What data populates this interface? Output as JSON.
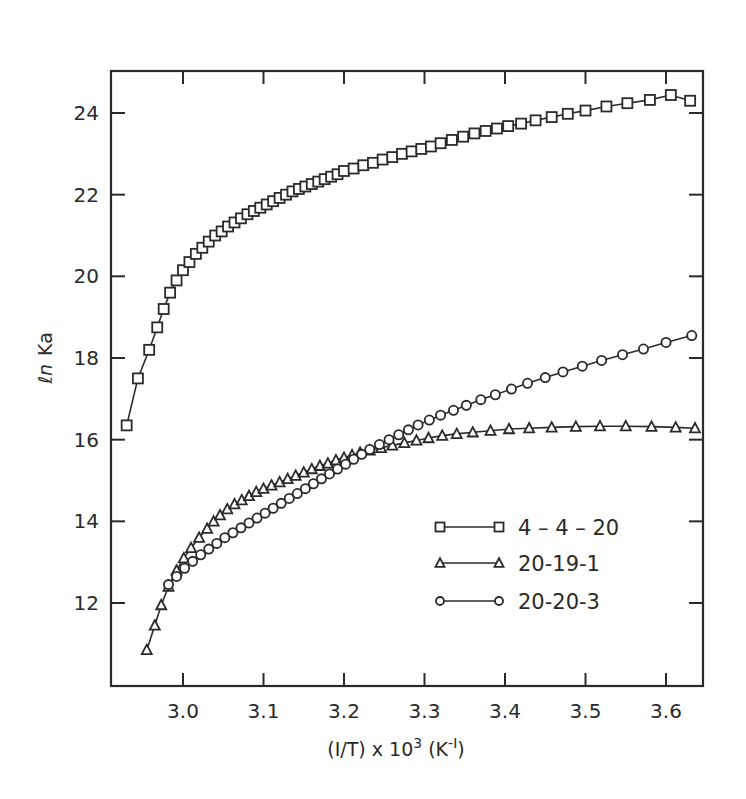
{
  "chart_data": {
    "type": "line",
    "title": "",
    "xlabel": "(I/T) x 10^3 (K^-1)",
    "xlabel_parts": {
      "prefix": "(I/T)  x  10",
      "sup": "3",
      "mid": " (K",
      "sup2": "-I",
      "suffix": ")"
    },
    "ylabel": "ln Ka",
    "ylabel_parts": {
      "ln": "ℓn",
      "k": "Ka"
    },
    "xlim": [
      2.91,
      3.645
    ],
    "ylim": [
      10.35,
      25.35
    ],
    "xticks": [
      3.0,
      3.1,
      3.2,
      3.3,
      3.4,
      3.5,
      3.6
    ],
    "xtick_labels": [
      "3.0",
      "3.1",
      "3.2",
      "3.3",
      "3.4",
      "3.5",
      "3.6"
    ],
    "yticks": [
      12,
      14,
      16,
      18,
      20,
      22,
      24
    ],
    "ytick_labels": [
      "12",
      "14",
      "16",
      "18",
      "20",
      "22",
      "24"
    ],
    "grid": false,
    "legend_position": "lower right",
    "series": [
      {
        "name": "4-4-20",
        "label": "4 – 4 – 20",
        "marker": "square",
        "x": [
          2.93,
          2.944,
          2.958,
          2.968,
          2.976,
          2.984,
          2.992,
          3.0,
          3.008,
          3.016,
          3.024,
          3.032,
          3.04,
          3.048,
          3.056,
          3.064,
          3.072,
          3.08,
          3.088,
          3.096,
          3.104,
          3.112,
          3.12,
          3.128,
          3.136,
          3.144,
          3.152,
          3.16,
          3.168,
          3.176,
          3.184,
          3.192,
          3.2,
          3.212,
          3.224,
          3.236,
          3.248,
          3.26,
          3.272,
          3.284,
          3.296,
          3.308,
          3.32,
          3.334,
          3.348,
          3.362,
          3.376,
          3.39,
          3.404,
          3.42,
          3.438,
          3.458,
          3.478,
          3.5,
          3.526,
          3.552,
          3.58,
          3.606,
          3.63
        ],
        "y": [
          16.35,
          17.5,
          18.2,
          18.75,
          19.2,
          19.6,
          19.9,
          20.15,
          20.35,
          20.55,
          20.7,
          20.85,
          21.0,
          21.1,
          21.22,
          21.32,
          21.42,
          21.52,
          21.6,
          21.68,
          21.76,
          21.84,
          21.92,
          22.0,
          22.08,
          22.14,
          22.2,
          22.26,
          22.32,
          22.38,
          22.44,
          22.5,
          22.58,
          22.64,
          22.72,
          22.78,
          22.86,
          22.92,
          23.0,
          23.06,
          23.12,
          23.18,
          23.26,
          23.34,
          23.42,
          23.5,
          23.56,
          23.62,
          23.68,
          23.74,
          23.82,
          23.9,
          23.98,
          24.06,
          24.16,
          24.24,
          24.32,
          24.44,
          24.3
        ]
      },
      {
        "name": "20-19-1",
        "label": "20-19-1",
        "marker": "triangle",
        "x": [
          2.955,
          2.965,
          2.973,
          2.982,
          2.992,
          3.001,
          3.01,
          3.02,
          3.03,
          3.038,
          3.046,
          3.055,
          3.064,
          3.073,
          3.082,
          3.091,
          3.1,
          3.11,
          3.12,
          3.13,
          3.14,
          3.15,
          3.16,
          3.17,
          3.18,
          3.19,
          3.2,
          3.21,
          3.22,
          3.232,
          3.246,
          3.26,
          3.275,
          3.29,
          3.305,
          3.322,
          3.34,
          3.36,
          3.382,
          3.405,
          3.43,
          3.458,
          3.488,
          3.518,
          3.55,
          3.582,
          3.612,
          3.636
        ],
        "y": [
          10.85,
          11.45,
          11.95,
          12.4,
          12.8,
          13.1,
          13.35,
          13.6,
          13.82,
          14.0,
          14.15,
          14.3,
          14.42,
          14.52,
          14.62,
          14.72,
          14.8,
          14.88,
          14.96,
          15.04,
          15.12,
          15.2,
          15.28,
          15.36,
          15.42,
          15.5,
          15.56,
          15.62,
          15.68,
          15.74,
          15.8,
          15.86,
          15.92,
          15.98,
          16.04,
          16.1,
          16.14,
          16.18,
          16.22,
          16.26,
          16.28,
          16.3,
          16.32,
          16.33,
          16.33,
          16.32,
          16.3,
          16.28
        ]
      },
      {
        "name": "20-20-3",
        "label": "20-20-3",
        "marker": "circle",
        "x": [
          2.982,
          2.992,
          3.002,
          3.012,
          3.022,
          3.032,
          3.042,
          3.052,
          3.062,
          3.072,
          3.082,
          3.092,
          3.102,
          3.112,
          3.122,
          3.132,
          3.142,
          3.152,
          3.162,
          3.172,
          3.182,
          3.192,
          3.202,
          3.212,
          3.222,
          3.232,
          3.244,
          3.256,
          3.268,
          3.28,
          3.292,
          3.306,
          3.32,
          3.336,
          3.352,
          3.37,
          3.388,
          3.408,
          3.428,
          3.45,
          3.472,
          3.496,
          3.52,
          3.546,
          3.572,
          3.6,
          3.632
        ],
        "y": [
          12.45,
          12.65,
          12.85,
          13.02,
          13.18,
          13.32,
          13.46,
          13.6,
          13.72,
          13.84,
          13.96,
          14.08,
          14.2,
          14.32,
          14.44,
          14.56,
          14.68,
          14.8,
          14.92,
          15.04,
          15.16,
          15.28,
          15.4,
          15.52,
          15.64,
          15.76,
          15.88,
          16.0,
          16.12,
          16.24,
          16.36,
          16.48,
          16.6,
          16.72,
          16.84,
          16.98,
          17.1,
          17.24,
          17.38,
          17.52,
          17.66,
          17.8,
          17.94,
          18.08,
          18.22,
          18.38,
          18.55
        ]
      }
    ],
    "legend": [
      {
        "marker": "square",
        "label": "4 – 4 – 20"
      },
      {
        "marker": "triangle",
        "label": "20-19-1"
      },
      {
        "marker": "circle",
        "label": "20-20-3"
      }
    ],
    "colors": {
      "ink": "#2a2a2a",
      "background": "#ffffff"
    }
  }
}
